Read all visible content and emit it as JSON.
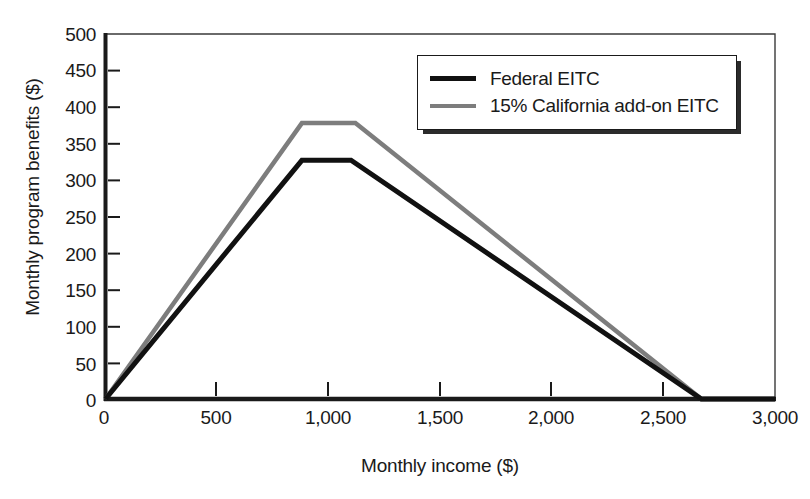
{
  "chart_data": {
    "type": "line",
    "title": "",
    "xlabel": "Monthly income ($)",
    "ylabel": "Monthly program benefits ($)",
    "xlim": [
      0,
      3000
    ],
    "ylim": [
      0,
      500
    ],
    "grid": false,
    "legend_position": "top-right",
    "x_ticks": [
      "0",
      "500",
      "1,000",
      "1,500",
      "2,000",
      "2,500",
      "3,000"
    ],
    "x_tick_values": [
      0,
      500,
      1000,
      1500,
      2000,
      2500,
      3000
    ],
    "y_ticks": [
      "0",
      "50",
      "100",
      "150",
      "200",
      "250",
      "300",
      "350",
      "400",
      "450",
      "500"
    ],
    "y_tick_values": [
      0,
      50,
      100,
      150,
      200,
      250,
      300,
      350,
      400,
      450,
      500
    ],
    "series": [
      {
        "name": "Federal EITC",
        "color": "#111111",
        "x": [
          0,
          880,
          1100,
          2670,
          3000
        ],
        "values": [
          0,
          327,
          327,
          0,
          0
        ]
      },
      {
        "name": "15% California add-on EITC",
        "color": "#7d7d7d",
        "x": [
          0,
          880,
          1120,
          2670,
          3000
        ],
        "values": [
          0,
          378,
          378,
          0,
          0
        ]
      }
    ]
  },
  "legend": {
    "items": [
      {
        "label": "Federal EITC",
        "swatch": "federal"
      },
      {
        "label": "15% California add-on EITC",
        "swatch": "california"
      }
    ]
  },
  "colors": {
    "federal": "#111111",
    "california": "#7d7d7d",
    "axis": "#1a1a1a",
    "frame": "#3a3a3a",
    "background": "#ffffff"
  }
}
